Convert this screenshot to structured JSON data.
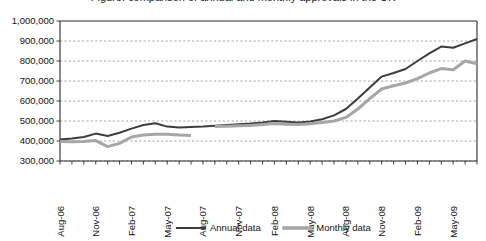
{
  "chart_data": {
    "type": "line",
    "title": "Figure: comparison of annual and monthly approvals in the UK",
    "xlabel": "",
    "ylabel": "",
    "ylim": [
      300000,
      1000000
    ],
    "ytick_step": 100000,
    "yticks": [
      "300,000",
      "400,000",
      "500,000",
      "600,000",
      "700,000",
      "800,000",
      "900,000",
      "1,000,000"
    ],
    "ytick_values": [
      300000,
      400000,
      500000,
      600000,
      700000,
      800000,
      900000,
      1000000
    ],
    "grid": true,
    "legend_position": "bottom",
    "x": [
      "Aug-06",
      "Sep-06",
      "Oct-06",
      "Nov-06",
      "Dec-06",
      "Jan-07",
      "Feb-07",
      "Mar-07",
      "Apr-07",
      "May-07",
      "Jun-07",
      "Jul-07",
      "Aug-07",
      "Sep-07",
      "Oct-07",
      "Nov-07",
      "Dec-07",
      "Jan-08",
      "Feb-08",
      "Mar-08",
      "Apr-08",
      "May-08",
      "Jun-08",
      "Jul-08",
      "Aug-08",
      "Sep-08",
      "Oct-08",
      "Nov-08",
      "Dec-08",
      "Jan-09",
      "Feb-09",
      "Mar-09",
      "Apr-09",
      "May-09",
      "Jun-09",
      "Jul-09"
    ],
    "xtick_labels": [
      "Aug-06",
      "Nov-06",
      "Feb-07",
      "May-07",
      "Aug-07",
      "Nov-07",
      "Feb-08",
      "May-08",
      "Aug-08",
      "Nov-08",
      "Feb-09",
      "May-09"
    ],
    "xtick_label_every": 3,
    "series": [
      {
        "name": "Annual data",
        "color": "#3d3d3d",
        "width": 2.0,
        "values": [
          408000,
          412000,
          420000,
          437000,
          425000,
          441000,
          462000,
          480000,
          489000,
          472000,
          468000,
          470000,
          472000,
          476000,
          480000,
          484000,
          487000,
          492000,
          500000,
          496000,
          493000,
          498000,
          509000,
          528000,
          560000,
          612000,
          668000,
          722000,
          740000,
          760000,
          800000,
          838000,
          872000,
          866000,
          888000,
          910000
        ]
      },
      {
        "name": "Monthly data",
        "color": "#a6a6a6",
        "width": 3.0,
        "values": [
          398000,
          396000,
          398000,
          402000,
          372000,
          388000,
          420000,
          430000,
          434000,
          434000,
          430000,
          428000,
          null,
          472000,
          474000,
          476000,
          478000,
          482000,
          487000,
          484000,
          482000,
          486000,
          492000,
          500000,
          518000,
          560000,
          612000,
          660000,
          676000,
          690000,
          712000,
          740000,
          762000,
          756000,
          800000,
          786000
        ]
      }
    ],
    "legend": [
      {
        "label": "Annual data",
        "color": "#3d3d3d",
        "width": 2.0
      },
      {
        "label": "Monthly data",
        "color": "#a6a6a6",
        "width": 3.6
      }
    ]
  }
}
